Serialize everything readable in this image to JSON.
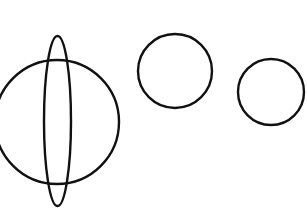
{
  "figure": {
    "background_color": "#ffffff",
    "stroke_color": "#111111",
    "canvas": {
      "width": 307,
      "height": 211
    },
    "shapes": [
      {
        "id": "large-circle",
        "name": "large-circle",
        "type": "circle",
        "cx": 57,
        "cy": 122,
        "r": 62,
        "stroke_width": 2.4,
        "note": "left edge clipped by canvas boundary"
      },
      {
        "id": "vertical-lens",
        "name": "vertical-lens-ellipse",
        "type": "ellipse",
        "cx": 57.5,
        "cy": 121,
        "rx": 13.5,
        "ry": 85,
        "stroke_width": 2.4,
        "note": "tall narrow spindle overlapping the large circle"
      },
      {
        "id": "middle-circle",
        "name": "middle-circle",
        "type": "circle",
        "cx": 175,
        "cy": 71,
        "r": 37,
        "stroke_width": 2.4
      },
      {
        "id": "right-circle",
        "name": "right-circle",
        "type": "circle",
        "cx": 271,
        "cy": 92,
        "r": 33,
        "stroke_width": 2.4,
        "note": "right edge near canvas boundary"
      }
    ]
  }
}
